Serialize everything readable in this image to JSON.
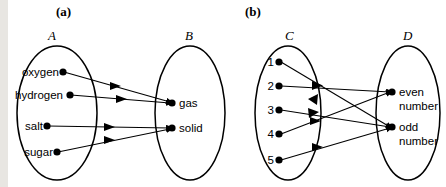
{
  "figure": {
    "title_a": "(a)",
    "title_b": "(b)",
    "background": "#ffffff",
    "ink": "#000000",
    "left_strip_color": "#e8e6e2"
  },
  "panels": [
    {
      "key": "a",
      "label": "(a)",
      "domain": {
        "name": "A",
        "items": [
          "oxygen",
          "hydrogen",
          "salt",
          "sugar"
        ]
      },
      "codomain": {
        "name": "B",
        "items": [
          "gas",
          "solid"
        ]
      },
      "mappings": [
        {
          "from": "oxygen",
          "to": "gas"
        },
        {
          "from": "hydrogen",
          "to": "gas"
        },
        {
          "from": "salt",
          "to": "solid"
        },
        {
          "from": "sugar",
          "to": "solid"
        }
      ]
    },
    {
      "key": "b",
      "label": "(b)",
      "domain": {
        "name": "C",
        "items": [
          "1",
          "2",
          "3",
          "4",
          "5"
        ]
      },
      "codomain": {
        "name": "D",
        "items": [
          "even number",
          "odd number"
        ]
      },
      "mappings": [
        {
          "from": "1",
          "to": "odd number"
        },
        {
          "from": "2",
          "to": "even number"
        },
        {
          "from": "3",
          "to": "odd number"
        },
        {
          "from": "4",
          "to": "even number"
        },
        {
          "from": "5",
          "to": "odd number"
        }
      ]
    }
  ],
  "labels": {
    "a_dom_1": "oxygen",
    "a_dom_2": "hydrogen",
    "a_dom_3": "salt",
    "a_dom_4": "sugar",
    "a_cod_1": "gas",
    "a_cod_2": "solid",
    "a_set_left": "A",
    "a_set_right": "B",
    "b_dom_1": "1",
    "b_dom_2": "2",
    "b_dom_3": "3",
    "b_dom_4": "4",
    "b_dom_5": "5",
    "b_cod_1_line1": "even",
    "b_cod_1_line2": "number",
    "b_cod_2_line1": "odd",
    "b_cod_2_line2": "number",
    "b_set_left": "C",
    "b_set_right": "D"
  }
}
